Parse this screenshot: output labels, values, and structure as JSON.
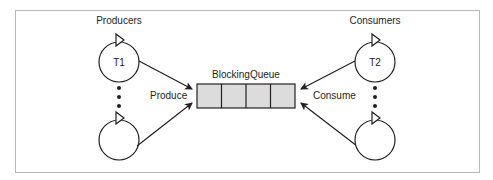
{
  "diagram": {
    "producers_label": "Producers",
    "consumers_label": "Consumers",
    "queue_label": "BlockingQueue",
    "produce_label": "Produce",
    "consume_label": "Consume",
    "producer_threads": [
      {
        "label": "T1"
      },
      {
        "label": ""
      }
    ],
    "consumer_threads": [
      {
        "label": "T2"
      },
      {
        "label": ""
      }
    ],
    "queue_slots": 4,
    "colors": {
      "stroke": "#231f20",
      "queue_fill": "#dcdcdc",
      "frame": "#b8b8b8"
    }
  }
}
